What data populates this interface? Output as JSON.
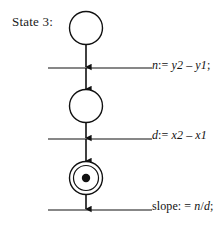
{
  "diagram": {
    "type": "petri-net-state-diagram",
    "background_color": "#ffffff",
    "stroke_color": "#111111",
    "label": "State 3:",
    "places": [
      {
        "name": "place-top",
        "kind": "circle",
        "cx": 86,
        "cy": 28,
        "r": 16,
        "tokens": 0
      },
      {
        "name": "place-middle",
        "kind": "circle",
        "cx": 86,
        "cy": 106,
        "r": 16,
        "tokens": 0
      },
      {
        "name": "place-bottom",
        "kind": "double-circle",
        "cx": 86,
        "cy": 178,
        "r": 16,
        "inner_r": 12,
        "tokens": 1,
        "token_r": 4
      }
    ],
    "transitions": [
      {
        "name": "transition-1",
        "y": 68,
        "x_start": 48,
        "x_end": 152,
        "annotation": "n:= y2 – y1;",
        "annotation_parts": [
          {
            "text": "n",
            "italic": true
          },
          {
            "text": ":= ",
            "italic": false
          },
          {
            "text": "y2",
            "italic": true
          },
          {
            "text": " – ",
            "italic": false
          },
          {
            "text": "y1",
            "italic": true
          },
          {
            "text": ";",
            "italic": false
          }
        ]
      },
      {
        "name": "transition-2",
        "y": 139,
        "x_start": 48,
        "x_end": 152,
        "annotation": "d:= x2 – x1",
        "annotation_parts": [
          {
            "text": "d",
            "italic": true
          },
          {
            "text": ":= ",
            "italic": false
          },
          {
            "text": "x2",
            "italic": true
          },
          {
            "text": " – ",
            "italic": false
          },
          {
            "text": "x1",
            "italic": true
          }
        ]
      },
      {
        "name": "transition-3",
        "y": 210,
        "x_start": 48,
        "x_end": 152,
        "annotation": "slope: = n/d;",
        "annotation_parts": [
          {
            "text": "slope: = ",
            "italic": false
          },
          {
            "text": "n",
            "italic": true
          },
          {
            "text": "/",
            "italic": false
          },
          {
            "text": "d",
            "italic": true
          },
          {
            "text": ";",
            "italic": false
          }
        ]
      }
    ],
    "arcs": [
      {
        "name": "arc-place-top-to-transition-1",
        "x": 86,
        "y_start": 44,
        "y_end": 68
      },
      {
        "name": "arc-transition-1-to-place-middle",
        "x": 86,
        "y_start": 68,
        "y_end": 90
      },
      {
        "name": "arc-place-middle-to-transition-2",
        "x": 86,
        "y_start": 122,
        "y_end": 139
      },
      {
        "name": "arc-transition-2-to-place-bottom",
        "x": 86,
        "y_start": 139,
        "y_end": 162
      },
      {
        "name": "arc-place-bottom-to-transition-3",
        "x": 86,
        "y_start": 194,
        "y_end": 210
      }
    ]
  },
  "annotations": {
    "a1": "n:= y2 – y1;",
    "a2": "d:= x2 – x1",
    "a3": "slope: = n/d;"
  }
}
